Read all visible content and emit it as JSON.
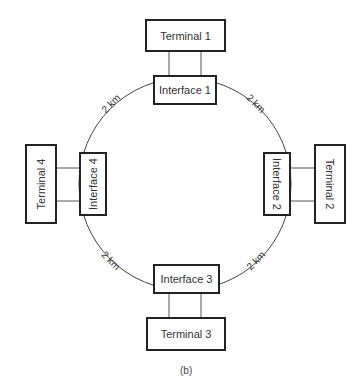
{
  "diagram": {
    "type": "ring-network",
    "caption": "(b)",
    "ring": {
      "center": [
        185,
        184
      ],
      "radius": 106
    },
    "terminals": [
      {
        "id": "t1",
        "label": "Terminal 1"
      },
      {
        "id": "t2",
        "label": "Terminal 2"
      },
      {
        "id": "t3",
        "label": "Terminal 3"
      },
      {
        "id": "t4",
        "label": "Terminal 4"
      }
    ],
    "interfaces": [
      {
        "id": "i1",
        "label": "Interface 1"
      },
      {
        "id": "i2",
        "label": "Interface 2"
      },
      {
        "id": "i3",
        "label": "Interface 3"
      },
      {
        "id": "i4",
        "label": "Interface 4"
      }
    ],
    "links": [
      {
        "from": "i1",
        "to": "i2",
        "label": "2 km"
      },
      {
        "from": "i2",
        "to": "i3",
        "label": "2 km"
      },
      {
        "from": "i3",
        "to": "i4",
        "label": "2 km"
      },
      {
        "from": "i4",
        "to": "i1",
        "label": "2 km"
      }
    ]
  }
}
